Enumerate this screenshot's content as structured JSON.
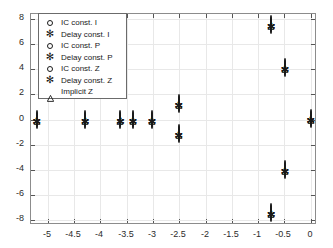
{
  "chart_data": {
    "type": "scatter",
    "title": "",
    "xlabel": "",
    "ylabel": "",
    "xlim": [
      -5.32,
      0.12
    ],
    "ylim": [
      -8.4,
      8.4
    ],
    "grid": true,
    "legend_position": "upper left",
    "xticks": [
      "-5",
      "-4.5",
      "-4",
      "-3.5",
      "-3",
      "-2.5",
      "-2",
      "-1.5",
      "-1",
      "-0.5",
      "0"
    ],
    "xtick_values": [
      -5,
      -4.5,
      -4,
      -3.5,
      -3,
      -2.5,
      -2,
      -1.5,
      -1,
      -0.5,
      0
    ],
    "yticks": [
      "8",
      "6",
      "4",
      "2",
      "0",
      "-2",
      "-4",
      "-6",
      "-8"
    ],
    "ytick_values": [
      8,
      6,
      4,
      2,
      0,
      -2,
      -4,
      -6,
      -8
    ],
    "legend": [
      {
        "label": "IC const. I",
        "marker": "circle-marker"
      },
      {
        "label": "Delay const. I",
        "marker": "asterisk-marker"
      },
      {
        "label": "IC const. P",
        "marker": "circle-marker"
      },
      {
        "label": "Delay const. P",
        "marker": "asterisk-marker"
      },
      {
        "label": "IC const. Z",
        "marker": "circle-marker"
      },
      {
        "label": "Delay const. Z",
        "marker": "asterisk-marker"
      },
      {
        "label": "Implicit Z",
        "marker": "triangle-marker"
      }
    ],
    "series": [
      {
        "name": "IC const. I",
        "marker": "circle-marker",
        "points": [
          [
            -5.21,
            0.0
          ],
          [
            -4.29,
            0.0
          ],
          [
            -3.62,
            0.0
          ],
          [
            -3.38,
            0.0
          ],
          [
            -3.02,
            0.0
          ],
          [
            0.0,
            0.05
          ],
          [
            -2.51,
            1.22
          ],
          [
            -2.51,
            -1.18
          ],
          [
            -0.75,
            7.53
          ],
          [
            -0.75,
            -7.45
          ],
          [
            -0.49,
            4.12
          ],
          [
            -0.49,
            -4.06
          ]
        ]
      },
      {
        "name": "Delay const. I",
        "marker": "asterisk-marker",
        "points": [
          [
            -5.21,
            0.0
          ],
          [
            -4.29,
            0.0
          ],
          [
            -3.62,
            0.0
          ],
          [
            -3.38,
            0.0
          ],
          [
            -3.02,
            0.0
          ],
          [
            0.0,
            0.05
          ],
          [
            -2.51,
            1.22
          ],
          [
            -2.51,
            -1.18
          ],
          [
            -0.75,
            7.53
          ],
          [
            -0.75,
            -7.45
          ],
          [
            -0.49,
            4.12
          ],
          [
            -0.49,
            -4.06
          ]
        ]
      },
      {
        "name": "IC const. P",
        "marker": "circle-marker",
        "points": [
          [
            -5.21,
            0.0
          ],
          [
            -4.29,
            0.0
          ],
          [
            -3.62,
            0.0
          ],
          [
            -3.38,
            0.0
          ],
          [
            -3.02,
            0.0
          ],
          [
            0.0,
            0.05
          ],
          [
            -2.51,
            1.22
          ],
          [
            -2.51,
            -1.18
          ],
          [
            -0.75,
            7.53
          ],
          [
            -0.75,
            -7.45
          ],
          [
            -0.49,
            4.12
          ],
          [
            -0.49,
            -4.06
          ]
        ]
      },
      {
        "name": "Delay const. P",
        "marker": "asterisk-marker",
        "points": [
          [
            -5.21,
            0.0
          ],
          [
            -4.29,
            0.0
          ],
          [
            -3.62,
            0.0
          ],
          [
            -3.38,
            0.0
          ],
          [
            -3.02,
            0.0
          ],
          [
            0.0,
            0.05
          ],
          [
            -2.51,
            1.22
          ],
          [
            -2.51,
            -1.18
          ],
          [
            -0.75,
            7.53
          ],
          [
            -0.75,
            -7.45
          ],
          [
            -0.49,
            4.12
          ],
          [
            -0.49,
            -4.06
          ]
        ]
      },
      {
        "name": "IC const. Z",
        "marker": "circle-marker",
        "points": [
          [
            -5.21,
            0.0
          ],
          [
            -4.29,
            0.0
          ],
          [
            -3.62,
            0.0
          ],
          [
            -3.38,
            0.0
          ],
          [
            -3.02,
            0.0
          ],
          [
            0.0,
            0.05
          ],
          [
            -2.51,
            1.22
          ],
          [
            -2.51,
            -1.18
          ],
          [
            -0.75,
            7.53
          ],
          [
            -0.75,
            -7.45
          ],
          [
            -0.49,
            4.12
          ],
          [
            -0.49,
            -4.06
          ]
        ]
      },
      {
        "name": "Delay const. Z",
        "marker": "asterisk-marker",
        "points": [
          [
            -5.21,
            0.0
          ],
          [
            -4.29,
            0.0
          ],
          [
            -3.62,
            0.0
          ],
          [
            -3.38,
            0.0
          ],
          [
            -3.02,
            0.0
          ],
          [
            0.0,
            0.05
          ],
          [
            -2.51,
            1.22
          ],
          [
            -2.51,
            -1.18
          ],
          [
            -0.75,
            7.53
          ],
          [
            -0.75,
            -7.45
          ],
          [
            -0.49,
            4.12
          ],
          [
            -0.49,
            -4.06
          ]
        ]
      },
      {
        "name": "Implicit Z",
        "marker": "triangle-marker",
        "points": [
          [
            -5.21,
            0.0
          ],
          [
            -4.29,
            0.0
          ],
          [
            -3.62,
            0.0
          ],
          [
            -3.38,
            0.0
          ],
          [
            -3.02,
            0.0
          ],
          [
            0.0,
            0.05
          ],
          [
            -2.51,
            1.22
          ],
          [
            -2.51,
            -1.18
          ],
          [
            -0.75,
            7.53
          ],
          [
            -0.75,
            -7.45
          ],
          [
            -0.49,
            4.12
          ],
          [
            -0.49,
            -4.06
          ]
        ]
      }
    ]
  },
  "style": {
    "marker_color": "#1a1a1a",
    "grid_color": "#e8e8e8",
    "axis_color": "#8c8c8c",
    "background": "#ffffff",
    "text_color": "#2b2b2b"
  }
}
